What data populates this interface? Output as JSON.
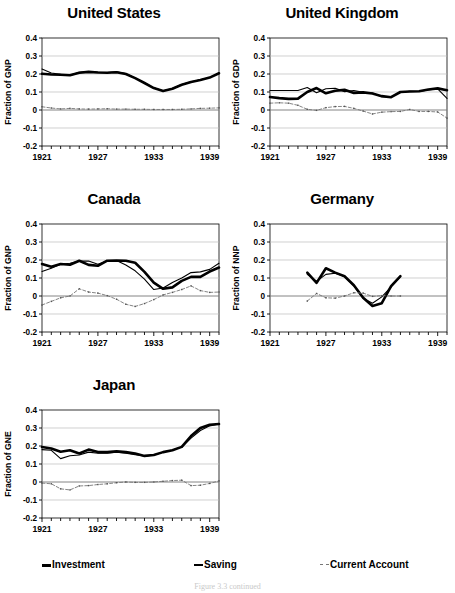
{
  "figure": {
    "caption": "Figure 3.3  continued"
  },
  "legend": {
    "items": [
      {
        "label": "Investment",
        "style": "solid-thick",
        "color": "#000000"
      },
      {
        "label": "Saving",
        "style": "solid-thin",
        "color": "#000000"
      },
      {
        "label": "Current Account",
        "style": "dashed",
        "color": "#777777"
      }
    ]
  },
  "panels": [
    {
      "title": "United States",
      "ylabel": "Fraction of GNP"
    },
    {
      "title": "United Kingdom",
      "ylabel": "Fraction of GDP"
    },
    {
      "title": "Canada",
      "ylabel": "Fraction of GNP"
    },
    {
      "title": "Germany",
      "ylabel": "Fraction of NNP"
    },
    {
      "title": "Japan",
      "ylabel": "Fraction of GNE"
    }
  ],
  "chart_data": [
    {
      "type": "line",
      "title": "United States",
      "xlabel": "",
      "ylabel": "Fraction of GNP",
      "xlim": [
        1921,
        1940
      ],
      "ylim": [
        -0.2,
        0.4
      ],
      "xticks": [
        1921,
        1927,
        1933,
        1939
      ],
      "yticks": [
        -0.2,
        -0.1,
        0,
        0.1,
        0.2,
        0.3,
        0.4
      ],
      "grid": true,
      "legend_position": "figure-bottom",
      "x": [
        1921,
        1922,
        1923,
        1924,
        1925,
        1926,
        1927,
        1928,
        1929,
        1930,
        1931,
        1932,
        1933,
        1934,
        1935,
        1936,
        1937,
        1938,
        1939,
        1940
      ],
      "series": [
        {
          "name": "Investment",
          "values": [
            0.201,
            0.197,
            0.196,
            0.193,
            0.207,
            0.212,
            0.208,
            0.207,
            0.21,
            0.2,
            0.177,
            0.15,
            0.122,
            0.106,
            0.118,
            0.14,
            0.156,
            0.167,
            0.18,
            0.204
          ]
        },
        {
          "name": "Saving",
          "values": [
            0.228,
            0.206,
            0.198,
            0.193,
            0.209,
            0.213,
            0.21,
            0.208,
            0.212,
            0.202,
            0.178,
            0.151,
            0.123,
            0.107,
            0.119,
            0.141,
            0.157,
            0.168,
            0.181,
            0.205
          ]
        },
        {
          "name": "Current Account",
          "values": [
            0.018,
            0.011,
            0.006,
            0.009,
            0.006,
            0.005,
            0.006,
            0.007,
            0.005,
            0.005,
            0.004,
            0.004,
            0.003,
            0.003,
            0.003,
            0.004,
            0.006,
            0.009,
            0.01,
            0.012
          ]
        }
      ]
    },
    {
      "type": "line",
      "title": "United Kingdom",
      "xlabel": "",
      "ylabel": "Fraction of GDP",
      "xlim": [
        1921,
        1940
      ],
      "ylim": [
        -0.2,
        0.4
      ],
      "xticks": [
        1921,
        1927,
        1933,
        1939
      ],
      "yticks": [
        -0.2,
        -0.1,
        0,
        0.1,
        0.2,
        0.3,
        0.4
      ],
      "grid": true,
      "legend_position": "figure-bottom",
      "x": [
        1921,
        1922,
        1923,
        1924,
        1925,
        1926,
        1927,
        1928,
        1929,
        1930,
        1931,
        1932,
        1933,
        1934,
        1935,
        1936,
        1937,
        1938,
        1939,
        1940
      ],
      "series": [
        {
          "name": "Investment",
          "values": [
            0.072,
            0.066,
            0.062,
            0.063,
            0.1,
            0.122,
            0.093,
            0.107,
            0.112,
            0.095,
            0.098,
            0.092,
            0.077,
            0.071,
            0.1,
            0.103,
            0.104,
            0.114,
            0.12,
            0.11
          ]
        },
        {
          "name": "Saving",
          "values": [
            0.108,
            0.108,
            0.108,
            0.108,
            0.125,
            0.096,
            0.118,
            0.121,
            0.102,
            0.108,
            0.099,
            0.094,
            0.074,
            0.073,
            0.098,
            0.104,
            0.103,
            0.112,
            0.118,
            0.064
          ]
        },
        {
          "name": "Current Account",
          "values": [
            0.038,
            0.04,
            0.038,
            0.026,
            0.004,
            -0.002,
            0.013,
            0.019,
            0.02,
            0.009,
            -0.006,
            -0.022,
            -0.012,
            -0.009,
            -0.008,
            0.003,
            -0.008,
            -0.008,
            -0.011,
            -0.045
          ]
        }
      ]
    },
    {
      "type": "line",
      "title": "Canada",
      "xlabel": "",
      "ylabel": "Fraction of GNP",
      "xlim": [
        1921,
        1940
      ],
      "ylim": [
        -0.2,
        0.4
      ],
      "xticks": [
        1921,
        1927,
        1933,
        1939
      ],
      "yticks": [
        -0.2,
        -0.1,
        0,
        0.1,
        0.2,
        0.3,
        0.4
      ],
      "grid": true,
      "legend_position": "figure-bottom",
      "x": [
        1921,
        1922,
        1923,
        1924,
        1925,
        1926,
        1927,
        1928,
        1929,
        1930,
        1931,
        1932,
        1933,
        1934,
        1935,
        1936,
        1937,
        1938,
        1939,
        1940
      ],
      "series": [
        {
          "name": "Investment",
          "values": [
            0.178,
            0.162,
            0.178,
            0.174,
            0.196,
            0.173,
            0.168,
            0.196,
            0.197,
            0.196,
            0.185,
            0.134,
            0.074,
            0.04,
            0.048,
            0.084,
            0.106,
            0.106,
            0.136,
            0.158
          ]
        },
        {
          "name": "Saving",
          "values": [
            0.136,
            0.154,
            0.176,
            0.182,
            0.194,
            0.194,
            0.176,
            0.195,
            0.197,
            0.172,
            0.14,
            0.094,
            0.036,
            0.044,
            0.075,
            0.1,
            0.13,
            0.134,
            0.148,
            0.182
          ]
        },
        {
          "name": "Current Account",
          "values": [
            -0.05,
            -0.03,
            -0.01,
            0.0,
            0.04,
            0.022,
            0.016,
            0.002,
            -0.018,
            -0.046,
            -0.058,
            -0.042,
            -0.02,
            0.006,
            0.02,
            0.036,
            0.056,
            0.03,
            0.02,
            0.022
          ]
        }
      ]
    },
    {
      "type": "line",
      "title": "Germany",
      "xlabel": "",
      "ylabel": "Fraction of NNP",
      "xlim": [
        1921,
        1940
      ],
      "ylim": [
        -0.2,
        0.4
      ],
      "xticks": [
        1921,
        1927,
        1933,
        1939
      ],
      "yticks": [
        -0.2,
        -0.1,
        0,
        0.1,
        0.2,
        0.3,
        0.4
      ],
      "grid": true,
      "legend_position": "figure-bottom",
      "x": [
        1925,
        1926,
        1927,
        1928,
        1929,
        1930,
        1931,
        1932,
        1933,
        1934,
        1935
      ],
      "series": [
        {
          "name": "Investment",
          "values": [
            0.13,
            0.073,
            0.154,
            0.13,
            0.11,
            0.06,
            -0.01,
            -0.055,
            -0.04,
            0.055,
            0.11
          ]
        },
        {
          "name": "Saving",
          "values": [
            0.12,
            0.082,
            0.12,
            0.126,
            0.108,
            0.056,
            -0.012,
            -0.04,
            -0.005,
            0.05,
            0.108
          ]
        },
        {
          "name": "Current Account",
          "values": [
            -0.028,
            0.014,
            -0.01,
            -0.012,
            0.0,
            0.018,
            0.016,
            -0.002,
            0.002,
            0.0,
            0.0
          ]
        }
      ]
    },
    {
      "type": "line",
      "title": "Japan",
      "xlabel": "",
      "ylabel": "Fraction of GNE",
      "xlim": [
        1921,
        1940
      ],
      "ylim": [
        -0.2,
        0.4
      ],
      "xticks": [
        1921,
        1927,
        1933,
        1939
      ],
      "yticks": [
        -0.2,
        -0.1,
        0,
        0.1,
        0.2,
        0.3,
        0.4
      ],
      "grid": true,
      "legend_position": "figure-bottom",
      "x": [
        1921,
        1922,
        1923,
        1924,
        1925,
        1926,
        1927,
        1928,
        1929,
        1930,
        1931,
        1932,
        1933,
        1934,
        1935,
        1936,
        1937,
        1938,
        1939,
        1940
      ],
      "series": [
        {
          "name": "Investment",
          "values": [
            0.194,
            0.186,
            0.168,
            0.176,
            0.158,
            0.18,
            0.166,
            0.166,
            0.17,
            0.166,
            0.158,
            0.145,
            0.15,
            0.166,
            0.176,
            0.195,
            0.255,
            0.3,
            0.318,
            0.322
          ]
        },
        {
          "name": "Saving",
          "values": [
            0.18,
            0.176,
            0.13,
            0.146,
            0.15,
            0.166,
            0.16,
            0.16,
            0.166,
            0.16,
            0.152,
            0.144,
            0.15,
            0.166,
            0.178,
            0.194,
            0.244,
            0.286,
            0.312,
            0.322
          ]
        },
        {
          "name": "Current Account",
          "values": [
            -0.006,
            -0.01,
            -0.038,
            -0.044,
            -0.022,
            -0.02,
            -0.014,
            -0.01,
            -0.004,
            0.0,
            -0.002,
            -0.002,
            0.0,
            0.004,
            0.008,
            0.01,
            -0.02,
            -0.018,
            -0.008,
            0.006
          ]
        }
      ]
    }
  ]
}
